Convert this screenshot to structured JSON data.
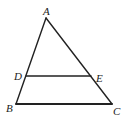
{
  "diagram": {
    "type": "geometry-triangle",
    "points": {
      "A": {
        "label": "A",
        "x": 46,
        "y": 18
      },
      "B": {
        "label": "B",
        "x": 16,
        "y": 104
      },
      "C": {
        "label": "C",
        "x": 112,
        "y": 104
      },
      "D": {
        "label": "D",
        "x": 26,
        "y": 76
      },
      "E": {
        "label": "E",
        "x": 91,
        "y": 76
      }
    },
    "segments": [
      {
        "from": "A",
        "to": "B"
      },
      {
        "from": "A",
        "to": "C"
      },
      {
        "from": "B",
        "to": "C"
      },
      {
        "from": "D",
        "to": "E"
      }
    ],
    "labels": {
      "A": "A",
      "B": "B",
      "C": "C",
      "D": "D",
      "E": "E"
    },
    "colors": {
      "line": "#222222",
      "background": "#ffffff"
    }
  }
}
